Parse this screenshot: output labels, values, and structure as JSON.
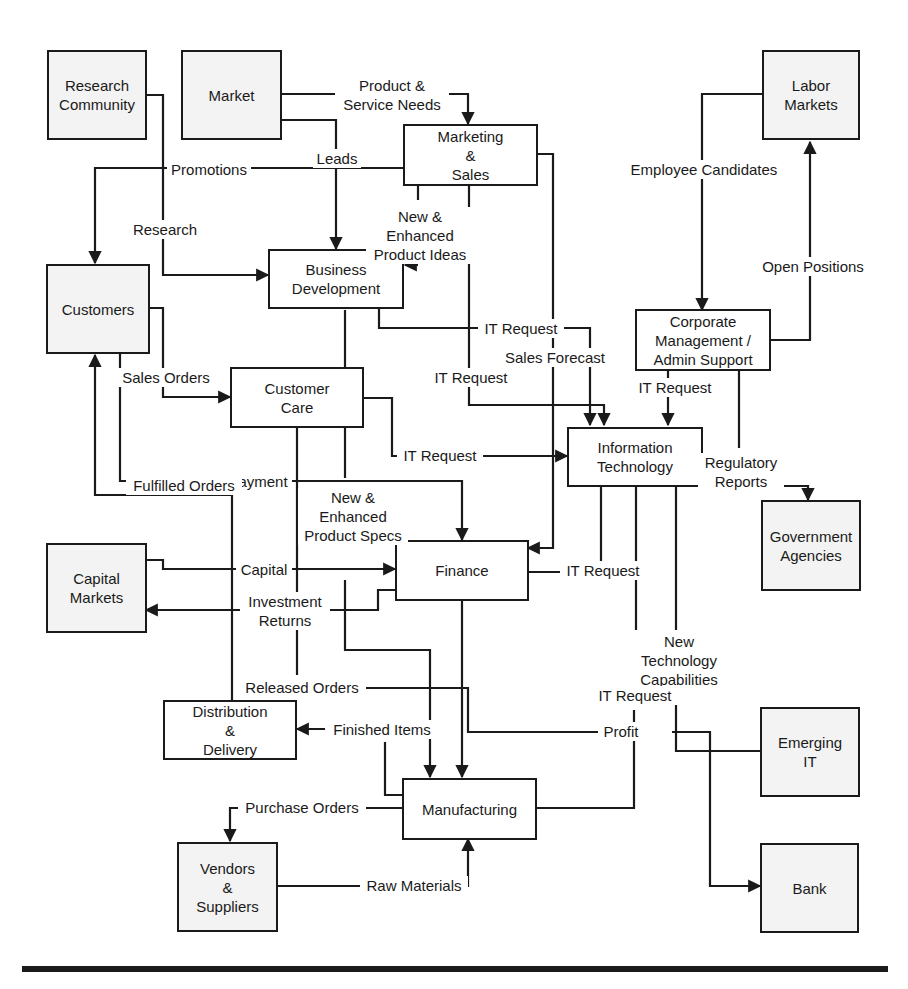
{
  "diagram": {
    "type": "data-flow diagram",
    "nodes": {
      "research_community": {
        "label": "Research\nCommunity",
        "kind": "external"
      },
      "market": {
        "label": "Market",
        "kind": "external"
      },
      "labor_markets": {
        "label": "Labor\nMarkets",
        "kind": "external"
      },
      "marketing_sales": {
        "label": "Marketing\n&\nSales",
        "kind": "internal"
      },
      "customers": {
        "label": "Customers",
        "kind": "external"
      },
      "business_development": {
        "label": "Business\nDevelopment",
        "kind": "internal"
      },
      "corporate_management": {
        "label": "Corporate\nManagement /\nAdmin Support",
        "kind": "internal"
      },
      "customer_care": {
        "label": "Customer\nCare",
        "kind": "internal"
      },
      "information_technology": {
        "label": "Information\nTechnology",
        "kind": "internal"
      },
      "government_agencies": {
        "label": "Government\nAgencies",
        "kind": "external"
      },
      "capital_markets": {
        "label": "Capital\nMarkets",
        "kind": "external"
      },
      "finance": {
        "label": "Finance",
        "kind": "internal"
      },
      "distribution_delivery": {
        "label": "Distribution\n&\nDelivery",
        "kind": "internal"
      },
      "emerging_it": {
        "label": "Emerging\nIT",
        "kind": "external"
      },
      "manufacturing": {
        "label": "Manufacturing",
        "kind": "internal"
      },
      "vendors_suppliers": {
        "label": "Vendors\n&\nSuppliers",
        "kind": "external"
      },
      "bank": {
        "label": "Bank",
        "kind": "external"
      }
    },
    "flows": {
      "product_service_needs": "Product &\nService Needs",
      "leads": "Leads",
      "promotions": "Promotions",
      "research": "Research",
      "new_enhanced_product_ideas": "New &\nEnhanced\nProduct Ideas",
      "employee_candidates": "Employee Candidates",
      "open_positions": "Open Positions",
      "it_request_bizdev": "IT Request",
      "sales_forecast": "Sales Forecast",
      "it_request_marketing": "IT Request",
      "it_request_corporate": "IT Request",
      "sales_orders": "Sales Orders",
      "it_request_customer_care": "IT Request",
      "payment": "Payment",
      "regulatory_reports": "Regulatory\nReports",
      "fulfilled_orders": "Fulfilled Orders",
      "new_enhanced_product_specs": "New &\nEnhanced\nProduct Specs",
      "capital": "Capital",
      "it_request_finance": "IT Request",
      "investment_returns": "Investment\nReturns",
      "new_technology_capabilities": "New\nTechnology\nCapabilities",
      "released_orders": "Released Orders",
      "it_request_manufacturing": "IT Request",
      "finished_items": "Finished Items",
      "profit": "Profit",
      "purchase_orders": "Purchase Orders",
      "raw_materials": "Raw Materials"
    },
    "colors": {
      "line": "#1a1a1a",
      "external_fill": "#f3f3f3",
      "internal_fill": "#ffffff"
    }
  }
}
